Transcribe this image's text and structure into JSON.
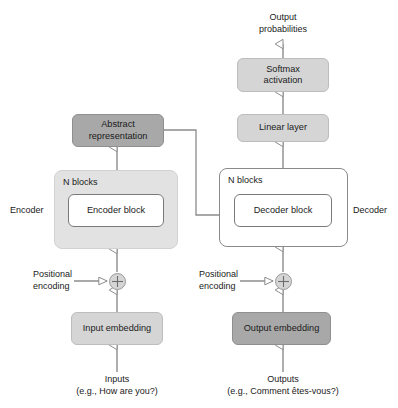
{
  "diagram": {
    "colors": {
      "box_light": "#d5d5d5",
      "box_dark": "#a8a8a8",
      "box_white": "#ffffff",
      "container_shaded": "#e2e2e2",
      "line": "#8c8c8c",
      "text": "#1a1a1a",
      "background": "#ffffff"
    }
  },
  "nodes": {
    "softmax": {
      "label": "Softmax\nactivation",
      "line1": "Softmax",
      "line2": "activation",
      "fill": "light"
    },
    "linear": {
      "label": "Linear layer",
      "fill": "light"
    },
    "abstract": {
      "label": "Abstract\nrepresentation",
      "line1": "Abstract",
      "line2": "representation",
      "fill": "dark"
    },
    "encoder_block": {
      "label": "Encoder block",
      "fill": "white"
    },
    "decoder_block": {
      "label": "Decoder block",
      "fill": "white"
    },
    "input_embedding": {
      "label": "Input embedding",
      "fill": "light"
    },
    "output_embedding": {
      "label": "Output embedding",
      "fill": "dark"
    },
    "encoder_sum": {
      "label": "plus-circle-icon"
    },
    "decoder_sum": {
      "label": "plus-circle-icon"
    }
  },
  "containers": {
    "encoder_stack": {
      "caption": "N blocks",
      "side_label": "Encoder"
    },
    "decoder_stack": {
      "caption": "N blocks",
      "side_label": "Decoder"
    }
  },
  "labels": {
    "output_probabilities_line1": "Output",
    "output_probabilities_line2": "probabilities",
    "positional_encoding_left_line1": "Positional",
    "positional_encoding_left_line2": "encoding",
    "positional_encoding_right_line1": "Positional",
    "positional_encoding_right_line2": "encoding",
    "inputs_line1": "Inputs",
    "inputs_line2": "(e.g., How are you?)",
    "outputs_line1": "Outputs",
    "outputs_line2": "(e.g., Comment êtes-vous?)"
  }
}
